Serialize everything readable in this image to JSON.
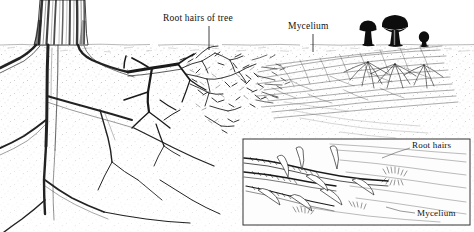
{
  "figure": {
    "background_color": "#ffffff",
    "ink_color": "#111111",
    "soil_color": "#b9b9b9",
    "width": 474,
    "height": 232
  },
  "labels": {
    "root_hairs_of_tree": "Root hairs of tree",
    "mycelium_main": "Mycelium",
    "root_hairs_inset": "Root hairs",
    "mycelium_inset": "Mycelium"
  },
  "scene": {
    "soil_surface_y": 44,
    "tree_trunk": "tree-trunk",
    "major_roots": "major-root-system",
    "fine_roots": "fine-root-hairs",
    "mycelium_field": "mycelium-threads",
    "mushrooms": [
      {
        "name": "mushroom-medium",
        "x": 368,
        "cap_width": 17,
        "stem_height": 18
      },
      {
        "name": "mushroom-large",
        "x": 395,
        "cap_width": 26,
        "stem_height": 20
      },
      {
        "name": "mushroom-button",
        "x": 424,
        "cap_width": 10,
        "stem_height": 9
      }
    ]
  },
  "inset": {
    "name": "detail-inset-panel",
    "x": 243,
    "y": 139,
    "width": 227,
    "height": 86,
    "border_color": "#333333",
    "background_color": "#ffffff",
    "content": "magnified-root-and-hyphae-detail"
  }
}
